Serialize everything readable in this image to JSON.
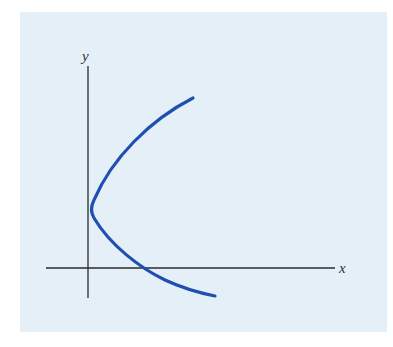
{
  "figure": {
    "type": "function-graph",
    "background_color": "#e5eff8",
    "axis_color": "#2a2a2a",
    "curve_color": "#1f4fb0",
    "x_axis_label": "x",
    "y_axis_label": "y"
  }
}
